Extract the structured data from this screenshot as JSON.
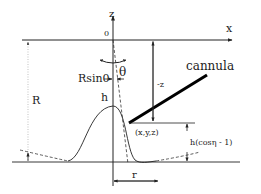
{
  "diagram": {
    "type": "geometry-schematic",
    "axes": {
      "x_label": "x",
      "z_label": "z",
      "origin_label": "0"
    },
    "labels": {
      "theta": "θ",
      "r_sin_theta": "Rsin0",
      "h": "h",
      "R": "R",
      "cannula": "cannula",
      "minus_z": "-z",
      "point": "(x,y,z)",
      "h_cos_eta": "h(cosη - 1)",
      "r": "r"
    },
    "colors": {
      "background": "#ffffff",
      "stroke": "#222222",
      "cannula": "#000000"
    }
  }
}
